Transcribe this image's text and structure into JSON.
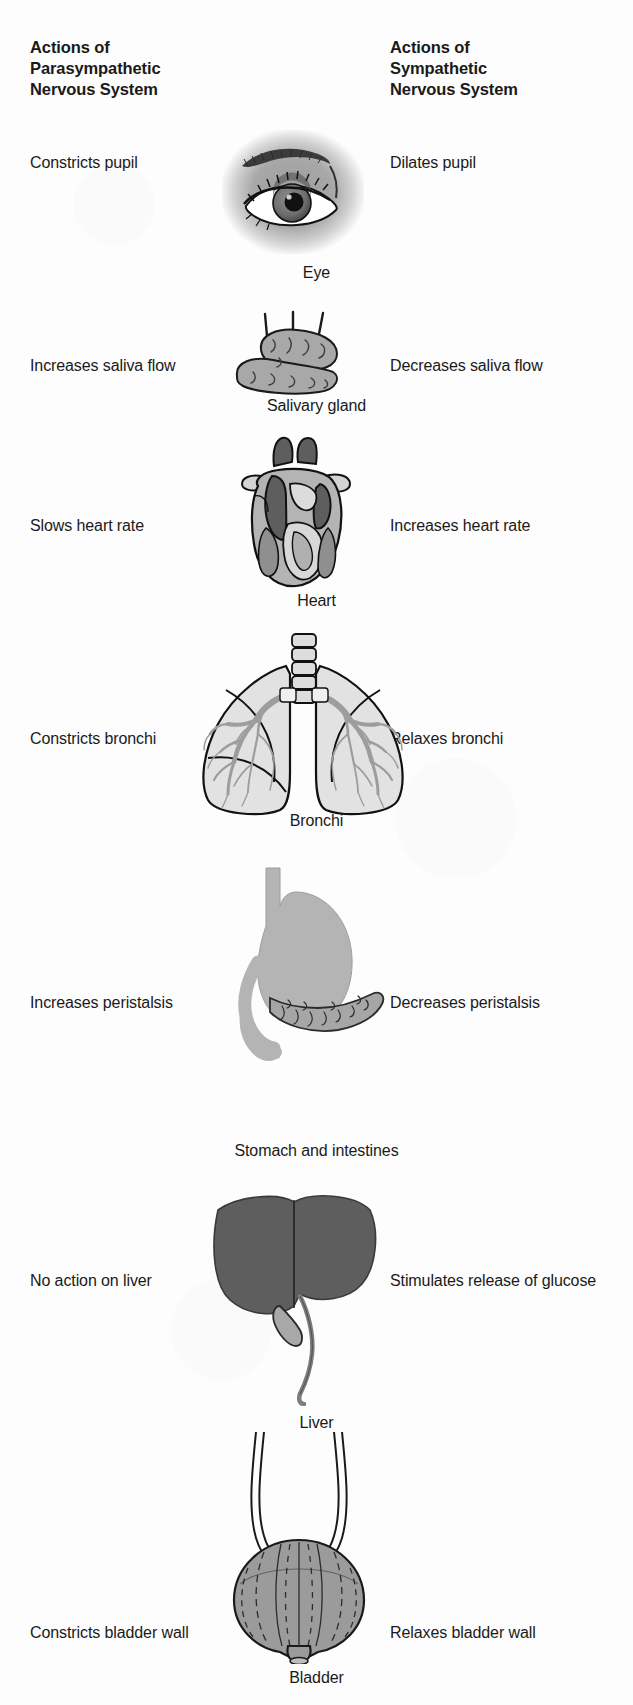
{
  "headers": {
    "left": "Actions of\nParasympathetic\nNervous System",
    "left_line1": "Actions of",
    "left_line2": "Parasympathetic",
    "left_line3": "Nervous System",
    "right_line1": "Actions of",
    "right_line2": "Sympathetic",
    "right_line3": "Nervous System"
  },
  "rows": [
    {
      "organ": "Eye",
      "parasympathetic": "Constricts pupil",
      "sympathetic": "Dilates pupil",
      "icon": "eye-illustration"
    },
    {
      "organ": "Salivary gland",
      "parasympathetic": "Increases saliva flow",
      "sympathetic": "Decreases saliva flow",
      "icon": "salivary-gland-illustration"
    },
    {
      "organ": "Heart",
      "parasympathetic": "Slows heart rate",
      "sympathetic": "Increases heart rate",
      "icon": "heart-illustration"
    },
    {
      "organ": "Bronchi",
      "parasympathetic": "Constricts bronchi",
      "sympathetic": "Relaxes bronchi",
      "icon": "lungs-illustration"
    },
    {
      "organ": "Stomach and intestines",
      "parasympathetic": "Increases peristalsis",
      "sympathetic": "Decreases peristalsis",
      "icon": "stomach-illustration"
    },
    {
      "organ": "Liver",
      "parasympathetic": "No action on liver",
      "sympathetic": "Stimulates release of glucose",
      "icon": "liver-illustration"
    },
    {
      "organ": "Bladder",
      "parasympathetic": "Constricts bladder wall",
      "sympathetic": "Relaxes bladder wall",
      "icon": "bladder-illustration"
    }
  ],
  "colors": {
    "page_background": "#fdfdfd",
    "text": "#1a1a1a",
    "organ_mid_gray": "#9b9b9b",
    "organ_light_gray": "#cfcfcf",
    "organ_dark_gray": "#5e5e5e",
    "outline": "#1a1a1a"
  }
}
